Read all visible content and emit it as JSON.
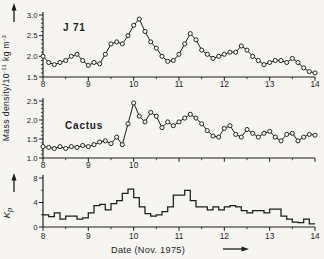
{
  "figure": {
    "paper_color": "#f6f5f1",
    "ink_color": "#1c1c1c",
    "ylabel": {
      "base": "Mass density/10",
      "exp1": "-11",
      "unit": " kg m",
      "exp2": "-3"
    },
    "kp_label": {
      "main": "K",
      "sub": "p"
    },
    "xlabel": "Date  (Nov. 1975)"
  },
  "chart_data": [
    {
      "type": "line",
      "title": "J 71",
      "marker": "open-circle",
      "ylabel_units": "10^-11 kg m^-3",
      "x_start": 8.0,
      "x_step": 0.125,
      "xlim": [
        8,
        14
      ],
      "xticks": [
        8,
        9,
        10,
        11,
        12,
        13,
        14
      ],
      "xtick_labeled": [
        {
          "v": 8,
          "label": "8"
        },
        {
          "v": 9,
          "label": "9"
        },
        {
          "v": 10,
          "label": "10"
        },
        {
          "v": 11,
          "label": "11"
        },
        {
          "v": 12,
          "label": "12"
        },
        {
          "v": 13,
          "label": "13"
        },
        {
          "v": 14,
          "label": "14"
        }
      ],
      "ylim": [
        1.5,
        3.0
      ],
      "y_minor_step": 0.1,
      "yticks_major": [
        1.5,
        2.0,
        2.5,
        3.0
      ],
      "ytick_labeled": [
        {
          "v": 1.5,
          "label": "1.5"
        },
        {
          "v": 2.0,
          "label": "2.0"
        },
        {
          "v": 2.5,
          "label": "2.5"
        },
        {
          "v": 3.0,
          "label": "3.0"
        }
      ],
      "values": [
        2.0,
        1.85,
        1.8,
        1.85,
        1.9,
        2.0,
        2.05,
        1.9,
        1.78,
        1.85,
        1.82,
        2.05,
        2.3,
        2.35,
        2.3,
        2.5,
        2.75,
        2.9,
        2.6,
        2.35,
        2.2,
        2.0,
        1.88,
        1.9,
        2.05,
        2.3,
        2.55,
        2.4,
        2.15,
        2.05,
        1.95,
        2.0,
        2.05,
        2.1,
        2.1,
        2.25,
        2.15,
        2.0,
        1.9,
        1.8,
        1.85,
        1.9,
        1.9,
        1.85,
        1.95,
        1.85,
        1.72,
        1.63,
        1.6
      ]
    },
    {
      "type": "line",
      "title": "Cactus",
      "marker": "open-circle",
      "ylabel_units": "10^-11 kg m^-3",
      "x_start": 8.0,
      "x_step": 0.125,
      "xlim": [
        8,
        14
      ],
      "xticks": [
        8,
        9,
        10,
        11,
        12,
        13,
        14
      ],
      "xtick_labeled": [
        {
          "v": 8,
          "label": "8"
        },
        {
          "v": 9,
          "label": "9"
        },
        {
          "v": 10,
          "label": "10"
        }
      ],
      "ylim": [
        1.0,
        2.5
      ],
      "y_minor_step": 0.1,
      "yticks_major": [
        1.0,
        1.5,
        2.0,
        2.5
      ],
      "ytick_labeled": [
        {
          "v": 1.0,
          "label": "1.0"
        },
        {
          "v": 1.5,
          "label": "1.5"
        },
        {
          "v": 2.0,
          "label": "2.0"
        },
        {
          "v": 2.5,
          "label": "2.5"
        }
      ],
      "values": [
        1.3,
        1.28,
        1.25,
        1.3,
        1.25,
        1.3,
        1.28,
        1.33,
        1.3,
        1.35,
        1.42,
        1.45,
        1.38,
        1.55,
        1.35,
        1.9,
        2.45,
        2.1,
        1.95,
        2.2,
        2.1,
        1.8,
        1.95,
        1.85,
        1.95,
        2.05,
        2.15,
        2.05,
        1.9,
        1.72,
        1.58,
        1.55,
        1.78,
        1.85,
        1.62,
        1.55,
        1.75,
        1.65,
        1.55,
        1.65,
        1.7,
        1.55,
        1.45,
        1.62,
        1.65,
        1.45,
        1.55,
        1.62,
        1.6
      ]
    },
    {
      "type": "step",
      "title": "Kp",
      "x_start": 8.0,
      "x_step": 0.125,
      "xlim": [
        8,
        14
      ],
      "xticks": [
        8,
        9,
        10,
        11,
        12,
        13,
        14
      ],
      "xtick_labeled": [
        {
          "v": 8,
          "label": "8"
        },
        {
          "v": 9,
          "label": "9"
        },
        {
          "v": 10,
          "label": "10"
        },
        {
          "v": 11,
          "label": "11"
        },
        {
          "v": 12,
          "label": "12"
        },
        {
          "v": 13,
          "label": "13"
        },
        {
          "v": 14,
          "label": "14"
        }
      ],
      "ylim": [
        0,
        8
      ],
      "y_minor_step": 2,
      "yticks_major": [
        0,
        4,
        8
      ],
      "ytick_labeled": [
        {
          "v": 0,
          "label": "0"
        },
        {
          "v": 4,
          "label": "4"
        },
        {
          "v": 8,
          "label": "8"
        }
      ],
      "values": [
        2.0,
        1.7,
        2.3,
        1.3,
        1.8,
        1.8,
        1.3,
        1.5,
        2.3,
        3.5,
        3.7,
        2.8,
        3.8,
        4.3,
        5.5,
        6.2,
        4.8,
        3.3,
        2.2,
        1.8,
        2.0,
        2.5,
        3.3,
        5.2,
        5.2,
        6.0,
        4.3,
        3.3,
        3.3,
        2.8,
        3.3,
        2.8,
        3.3,
        3.5,
        3.3,
        2.7,
        2.3,
        2.7,
        2.7,
        2.3,
        2.9,
        2.9,
        1.8,
        1.3,
        0.8,
        0.7,
        1.3,
        0.5
      ]
    }
  ]
}
